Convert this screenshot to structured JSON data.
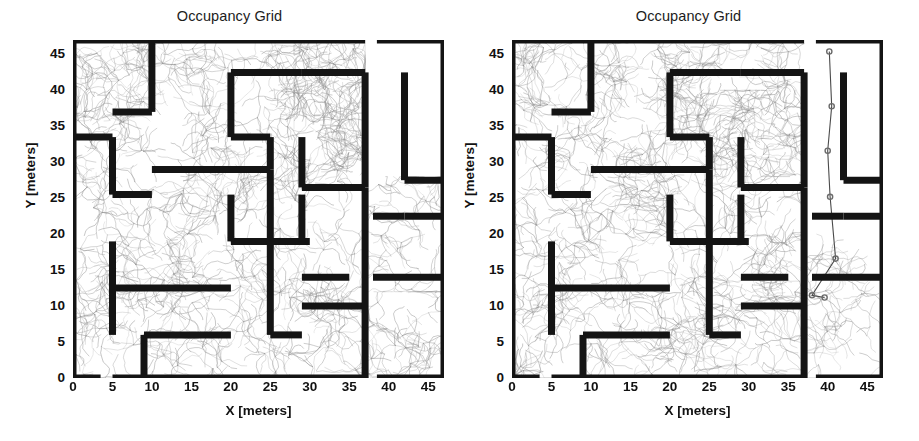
{
  "figure": {
    "width": 919,
    "height": 441,
    "background": "#ffffff",
    "panel_count": 2
  },
  "chart_data": {
    "type": "heatmap",
    "title": "Occupancy Grid",
    "xlabel": "X [meters]",
    "ylabel": "Y [meters]",
    "xlim": [
      0,
      47
    ],
    "ylim": [
      0,
      47
    ],
    "xticks": [
      0,
      5,
      10,
      15,
      20,
      25,
      30,
      35,
      40,
      45
    ],
    "yticks": [
      0,
      5,
      10,
      15,
      20,
      25,
      30,
      35,
      40,
      45
    ],
    "grid": false,
    "legend": null,
    "colors": {
      "occupied": "#141414",
      "free": "#ffffff",
      "unknown_noise": "#8d8d8d",
      "path": "#4a4a4a",
      "node_marker": "#6b6b6b",
      "text": "#111111"
    },
    "panels": [
      {
        "index": 0,
        "title": "Occupancy Grid",
        "description": "occupancy grid map of a maze-like indoor environment with dense laser-scan noise covering most of the free space",
        "xlabel": "X [meters]",
        "ylabel": "Y [meters]",
        "xticks": [
          0,
          5,
          10,
          15,
          20,
          25,
          30,
          35,
          40,
          45
        ],
        "yticks": [
          0,
          5,
          10,
          15,
          20,
          25,
          30,
          35,
          40,
          45
        ],
        "noise_regions": [
          {
            "x": 0,
            "y": 0,
            "w": 37,
            "h": 47,
            "density": "high"
          },
          {
            "x": 37,
            "y": 0,
            "w": 10,
            "h": 12,
            "density": "medium"
          },
          {
            "x": 37,
            "y": 12,
            "w": 10,
            "h": 16,
            "density": "medium"
          },
          {
            "x": 28,
            "y": 28,
            "w": 9,
            "h": 19,
            "density": "medium"
          }
        ],
        "node_markers": []
      },
      {
        "index": 1,
        "title": "Occupancy Grid",
        "description": "same occupancy grid with a topological graph overlay; circular node markers trace a route down the right corridor",
        "xlabel": "X [meters]",
        "ylabel": "Y [meters]",
        "xticks": [
          0,
          5,
          10,
          15,
          20,
          25,
          30,
          35,
          40,
          45
        ],
        "yticks": [
          0,
          5,
          10,
          15,
          20,
          25,
          30,
          35,
          40,
          45
        ],
        "noise_regions": [
          {
            "x": 0,
            "y": 0,
            "w": 37,
            "h": 47,
            "density": "high"
          },
          {
            "x": 25,
            "y": 28,
            "w": 12,
            "h": 12,
            "density": "medium"
          },
          {
            "x": 37,
            "y": 0,
            "w": 10,
            "h": 20,
            "density": "medium"
          }
        ],
        "node_markers": [
          {
            "x": 40.2,
            "y": 45.4
          },
          {
            "x": 40.5,
            "y": 37.8
          },
          {
            "x": 40.0,
            "y": 31.6
          },
          {
            "x": 40.3,
            "y": 25.2
          },
          {
            "x": 41.0,
            "y": 16.6
          },
          {
            "x": 38.0,
            "y": 11.5
          },
          {
            "x": 39.6,
            "y": 11.2
          }
        ]
      }
    ],
    "walls": [
      {
        "x1": 0.0,
        "y1": 0.0,
        "x2": 0.0,
        "y2": 47.0
      },
      {
        "x1": 0.0,
        "y1": 47.0,
        "x2": 37.0,
        "y2": 47.0
      },
      {
        "x1": 38.5,
        "y1": 47.0,
        "x2": 47.0,
        "y2": 47.0
      },
      {
        "x1": 47.0,
        "y1": 0.0,
        "x2": 47.0,
        "y2": 47.0
      },
      {
        "x1": 0.0,
        "y1": 0.0,
        "x2": 3.5,
        "y2": 0.0
      },
      {
        "x1": 5.0,
        "y1": 0.0,
        "x2": 37.0,
        "y2": 0.0
      },
      {
        "x1": 38.5,
        "y1": 0.0,
        "x2": 47.0,
        "y2": 0.0
      },
      {
        "x1": 10.0,
        "y1": 47.0,
        "x2": 10.0,
        "y2": 37.0
      },
      {
        "x1": 5.0,
        "y1": 37.0,
        "x2": 10.0,
        "y2": 37.0
      },
      {
        "x1": 0.0,
        "y1": 33.5,
        "x2": 5.0,
        "y2": 33.5
      },
      {
        "x1": 5.0,
        "y1": 33.5,
        "x2": 5.0,
        "y2": 25.5
      },
      {
        "x1": 5.0,
        "y1": 25.5,
        "x2": 10.0,
        "y2": 25.5
      },
      {
        "x1": 10.0,
        "y1": 29.0,
        "x2": 25.0,
        "y2": 29.0
      },
      {
        "x1": 25.0,
        "y1": 29.0,
        "x2": 25.0,
        "y2": 19.0
      },
      {
        "x1": 20.0,
        "y1": 19.0,
        "x2": 30.0,
        "y2": 19.0
      },
      {
        "x1": 20.0,
        "y1": 19.0,
        "x2": 20.0,
        "y2": 25.5
      },
      {
        "x1": 5.0,
        "y1": 19.0,
        "x2": 5.0,
        "y2": 6.0
      },
      {
        "x1": 5.0,
        "y1": 12.5,
        "x2": 20.0,
        "y2": 12.5
      },
      {
        "x1": 9.0,
        "y1": 6.0,
        "x2": 20.0,
        "y2": 6.0
      },
      {
        "x1": 9.0,
        "y1": 6.0,
        "x2": 9.0,
        "y2": 0.0
      },
      {
        "x1": 25.0,
        "y1": 19.0,
        "x2": 25.0,
        "y2": 6.0
      },
      {
        "x1": 25.0,
        "y1": 6.0,
        "x2": 29.0,
        "y2": 6.0
      },
      {
        "x1": 29.0,
        "y1": 10.0,
        "x2": 37.0,
        "y2": 10.0
      },
      {
        "x1": 29.0,
        "y1": 14.0,
        "x2": 35.0,
        "y2": 14.0
      },
      {
        "x1": 29.0,
        "y1": 19.0,
        "x2": 29.0,
        "y2": 25.5
      },
      {
        "x1": 29.0,
        "y1": 26.5,
        "x2": 37.0,
        "y2": 26.5
      },
      {
        "x1": 37.0,
        "y1": 0.0,
        "x2": 37.0,
        "y2": 26.5
      },
      {
        "x1": 29.0,
        "y1": 33.5,
        "x2": 29.0,
        "y2": 26.5
      },
      {
        "x1": 20.0,
        "y1": 42.5,
        "x2": 29.0,
        "y2": 42.5
      },
      {
        "x1": 20.0,
        "y1": 42.5,
        "x2": 20.0,
        "y2": 33.5
      },
      {
        "x1": 20.0,
        "y1": 33.5,
        "x2": 25.0,
        "y2": 33.5
      },
      {
        "x1": 25.0,
        "y1": 33.5,
        "x2": 25.0,
        "y2": 29.0
      },
      {
        "x1": 29.0,
        "y1": 42.5,
        "x2": 37.0,
        "y2": 42.5
      },
      {
        "x1": 37.0,
        "y1": 42.5,
        "x2": 37.0,
        "y2": 26.5
      },
      {
        "x1": 42.0,
        "y1": 42.5,
        "x2": 42.0,
        "y2": 27.5
      },
      {
        "x1": 42.0,
        "y1": 27.5,
        "x2": 47.0,
        "y2": 27.5
      },
      {
        "x1": 42.0,
        "y1": 22.5,
        "x2": 47.0,
        "y2": 22.5
      },
      {
        "x1": 38.0,
        "y1": 22.5,
        "x2": 42.0,
        "y2": 22.5
      },
      {
        "x1": 38.0,
        "y1": 14.0,
        "x2": 47.0,
        "y2": 14.0
      }
    ]
  }
}
